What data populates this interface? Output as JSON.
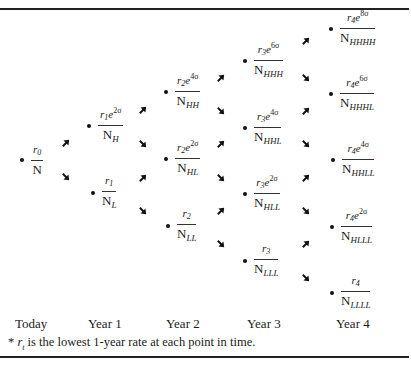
{
  "diagram": {
    "type": "binomial-interest-rate-tree",
    "columns": [
      "Today",
      "Year 1",
      "Year 2",
      "Year 3",
      "Year 4"
    ],
    "nodes": [
      {
        "id": "n0",
        "col": 0,
        "x": 22,
        "y": 160,
        "r": "r",
        "r_sub": "0",
        "exp": "",
        "N_sub": ""
      },
      {
        "id": "n1H",
        "col": 1,
        "x": 89,
        "y": 126,
        "r": "r",
        "r_sub": "1",
        "exp": "2σ",
        "N_sub": "H"
      },
      {
        "id": "n1L",
        "col": 1,
        "x": 93,
        "y": 193,
        "r": "r",
        "r_sub": "1",
        "exp": "",
        "N_sub": "L"
      },
      {
        "id": "n2HH",
        "col": 2,
        "x": 166,
        "y": 92,
        "r": "r",
        "r_sub": "2",
        "exp": "4σ",
        "N_sub": "HH"
      },
      {
        "id": "n2HL",
        "col": 2,
        "x": 166,
        "y": 159,
        "r": "r",
        "r_sub": "2",
        "exp": "2σ",
        "N_sub": "HL"
      },
      {
        "id": "n2LL",
        "col": 2,
        "x": 168,
        "y": 226,
        "r": "r",
        "r_sub": "2",
        "exp": "",
        "N_sub": "LL"
      },
      {
        "id": "n3HHH",
        "col": 3,
        "x": 245,
        "y": 61,
        "r": "r",
        "r_sub": "3",
        "exp": "6σ",
        "N_sub": "HHH"
      },
      {
        "id": "n3HHL",
        "col": 3,
        "x": 245,
        "y": 128,
        "r": "r",
        "r_sub": "3",
        "exp": "4σ",
        "N_sub": "HHL"
      },
      {
        "id": "n3HLL",
        "col": 3,
        "x": 245,
        "y": 194,
        "r": "r",
        "r_sub": "3",
        "exp": "2σ",
        "N_sub": "HLL"
      },
      {
        "id": "n3LLL",
        "col": 3,
        "x": 245,
        "y": 261,
        "r": "r",
        "r_sub": "3",
        "exp": "",
        "N_sub": "LLL"
      },
      {
        "id": "n4HHHH",
        "col": 4,
        "x": 331,
        "y": 29,
        "r": "r",
        "r_sub": "4",
        "exp": "8σ",
        "N_sub": "HHHH"
      },
      {
        "id": "n4HHHL",
        "col": 4,
        "x": 331,
        "y": 94,
        "r": "r",
        "r_sub": "4",
        "exp": "6σ",
        "N_sub": "HHHL"
      },
      {
        "id": "n4HHLL",
        "col": 4,
        "x": 333,
        "y": 160,
        "r": "r",
        "r_sub": "4",
        "exp": "4σ",
        "N_sub": "HHLL"
      },
      {
        "id": "n4HLLL",
        "col": 4,
        "x": 332,
        "y": 227,
        "r": "r",
        "r_sub": "4",
        "exp": "2σ",
        "N_sub": "HLLL"
      },
      {
        "id": "n4LLLL",
        "col": 4,
        "x": 332,
        "y": 293,
        "r": "r",
        "r_sub": "4",
        "exp": "",
        "N_sub": "LLLL"
      }
    ],
    "arrows": [
      {
        "x": 66,
        "y": 143,
        "dir": "up"
      },
      {
        "x": 66,
        "y": 177,
        "dir": "down"
      },
      {
        "x": 143,
        "y": 110,
        "dir": "up"
      },
      {
        "x": 143,
        "y": 144,
        "dir": "down"
      },
      {
        "x": 143,
        "y": 178,
        "dir": "up"
      },
      {
        "x": 143,
        "y": 211,
        "dir": "down"
      },
      {
        "x": 221,
        "y": 78,
        "dir": "up"
      },
      {
        "x": 221,
        "y": 111,
        "dir": "down"
      },
      {
        "x": 221,
        "y": 144,
        "dir": "up"
      },
      {
        "x": 221,
        "y": 178,
        "dir": "down"
      },
      {
        "x": 221,
        "y": 211,
        "dir": "up"
      },
      {
        "x": 221,
        "y": 244,
        "dir": "down"
      },
      {
        "x": 306,
        "y": 41,
        "dir": "up"
      },
      {
        "x": 306,
        "y": 78,
        "dir": "down"
      },
      {
        "x": 306,
        "y": 111,
        "dir": "up"
      },
      {
        "x": 306,
        "y": 144,
        "dir": "down"
      },
      {
        "x": 306,
        "y": 178,
        "dir": "up"
      },
      {
        "x": 306,
        "y": 211,
        "dir": "down"
      },
      {
        "x": 306,
        "y": 244,
        "dir": "up"
      },
      {
        "x": 306,
        "y": 278,
        "dir": "down"
      }
    ],
    "labels": [
      {
        "text": "Today",
        "x": 15
      },
      {
        "text": "Year 1",
        "x": 88
      },
      {
        "text": "Year 2",
        "x": 166
      },
      {
        "text": "Year 3",
        "x": 247
      },
      {
        "text": "Year 4",
        "x": 336
      }
    ],
    "footnote": {
      "marker": "* ",
      "var": "r",
      "var_sub": "t",
      "text": " is the lowest 1-year rate at each point in time."
    },
    "N_letter": "N",
    "e_letter": "e"
  }
}
